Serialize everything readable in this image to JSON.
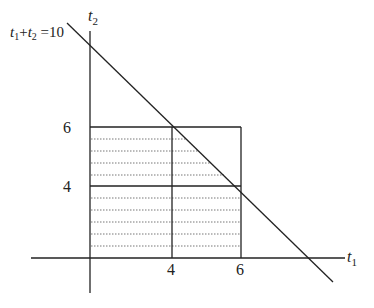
{
  "diagram": {
    "constraint_label": {
      "a": "t",
      "a_sub": "1",
      "plus": "+",
      "b": "t",
      "b_sub": "2",
      "eq": " =10"
    },
    "y_axis_label": {
      "var": "t",
      "sub": "2"
    },
    "x_axis_label": {
      "var": "t",
      "sub": "1"
    },
    "y_ticks": [
      {
        "label": "6",
        "value": 6
      },
      {
        "label": "4",
        "value": 4
      }
    ],
    "x_ticks": [
      {
        "label": "4",
        "value": 4
      },
      {
        "label": "6",
        "value": 6
      }
    ],
    "line_equation": "t1 + t2 = 10",
    "region": {
      "t1_max": 6,
      "t2_max": 6,
      "hatched": "dotted horizontal lines below the constraint line"
    },
    "colors": {
      "stroke": "#222222",
      "dotted": "#777777",
      "background": "#ffffff"
    }
  }
}
